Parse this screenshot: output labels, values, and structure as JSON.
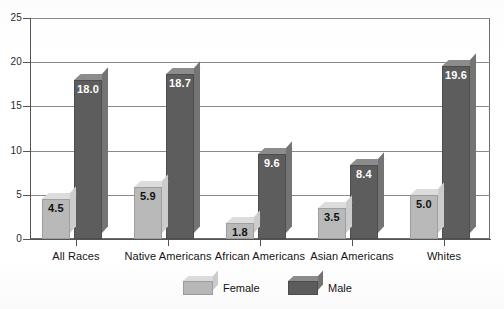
{
  "chart_data": {
    "type": "bar",
    "title": "",
    "subtitle": "",
    "xlabel": "",
    "ylabel": "",
    "ylim": [
      0,
      25
    ],
    "yticks": [
      "0",
      "5",
      "10",
      "15",
      "20",
      "25"
    ],
    "grid": true,
    "legend_position": "bottom",
    "style": "3d-bar-grouped",
    "categories": [
      "All Races",
      "Native Americans",
      "African Americans",
      "Asian Americans",
      "Whites"
    ],
    "series": [
      {
        "name": "Female",
        "color": "#b9b9b9",
        "values": [
          4.5,
          5.9,
          1.8,
          3.5,
          5.0
        ],
        "labels": [
          "4.5",
          "5.9",
          "1.8",
          "3.5",
          "5.0"
        ]
      },
      {
        "name": "Male",
        "color": "#5d5d5d",
        "values": [
          18.0,
          18.7,
          9.6,
          8.4,
          19.6
        ],
        "labels": [
          "18.0",
          "18.7",
          "9.6",
          "8.4",
          "19.6"
        ]
      }
    ]
  },
  "legend": {
    "items": [
      {
        "label": "Female",
        "swatch": "female-swatch-icon"
      },
      {
        "label": "Male",
        "swatch": "male-swatch-icon"
      }
    ]
  }
}
